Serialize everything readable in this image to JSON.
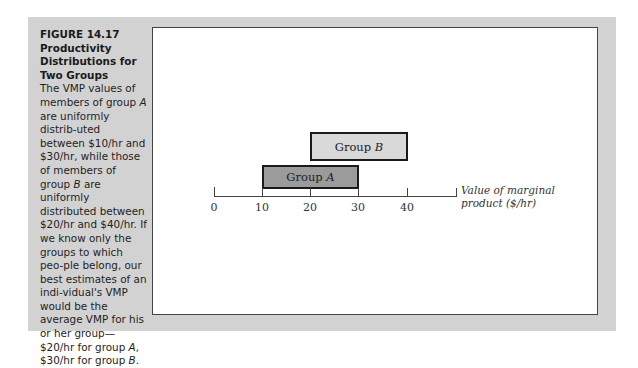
{
  "figure": {
    "number": "FIGURE 14.17",
    "title_lines": [
      "Productivity",
      "Distributions for",
      "Two Groups"
    ],
    "caption_segments": [
      {
        "text": "The VMP values of members of group "
      },
      {
        "text": "A",
        "italic": true
      },
      {
        "text": " are uniformly distrib-uted between $10/hr and $30/hr, while those of members of group "
      },
      {
        "text": "B",
        "italic": true
      },
      {
        "text": " are uniformly distributed between $20/hr and $40/hr. If we know only the groups to which peo-ple belong, our best estimates of an indi-vidual's VMP would be the average VMP for his or her group—$20/hr for group "
      },
      {
        "text": "A",
        "italic": true
      },
      {
        "text": ", $30/hr for group "
      },
      {
        "text": "B",
        "italic": true
      },
      {
        "text": "."
      }
    ]
  },
  "chart": {
    "axis_title_line1": "Value of marginal",
    "axis_title_line2": "product ($/hr)",
    "ticks": [
      "0",
      "10",
      "20",
      "30",
      "40"
    ],
    "groups": [
      {
        "name": "Group",
        "letter": "B",
        "min": 20,
        "max": 40,
        "fill": "#d9d9d9"
      },
      {
        "name": "Group",
        "letter": "A",
        "min": 10,
        "max": 30,
        "fill": "#9b9b9b"
      }
    ]
  },
  "chart_data": {
    "type": "bar",
    "subtype": "horizontal-range",
    "title": "Productivity Distributions for Two Groups",
    "xlabel": "Value of marginal product ($/hr)",
    "ylabel": "",
    "categories": [
      "Group A",
      "Group B"
    ],
    "series": [
      {
        "name": "Group A",
        "start": 10,
        "end": 30,
        "average": 20
      },
      {
        "name": "Group B",
        "start": 20,
        "end": 40,
        "average": 30
      }
    ],
    "xlim": [
      0,
      50
    ],
    "x_ticks": [
      0,
      10,
      20,
      30,
      40
    ],
    "grid": false,
    "legend": "none"
  },
  "colors": {
    "panel": "#d2d2d2",
    "group_a_fill": "#9b9b9b",
    "group_b_fill": "#d9d9d9",
    "outline": "#1a1a1a"
  }
}
